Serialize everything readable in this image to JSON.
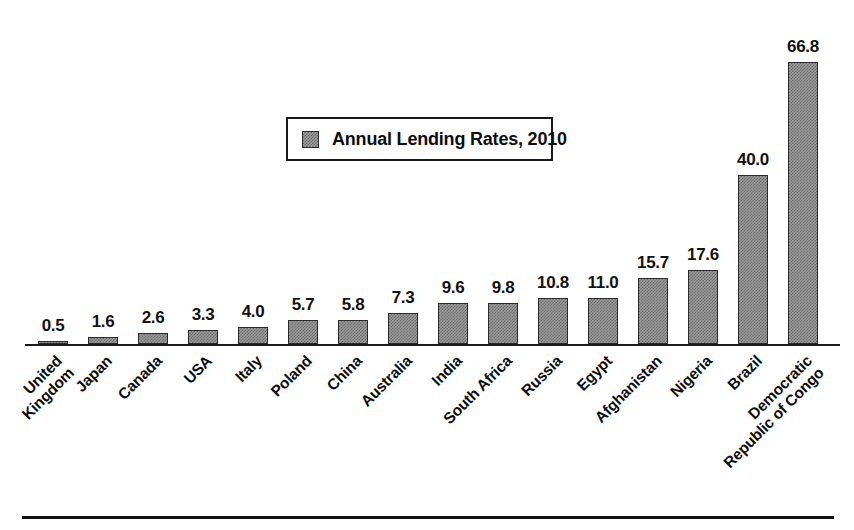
{
  "chart_data": {
    "type": "bar",
    "title": "",
    "subtitle": "",
    "xlabel": "",
    "ylabel": "",
    "ylim": [
      0,
      72
    ],
    "grid": false,
    "legend_position": "upper-center-inside",
    "series": [
      {
        "name": "Annual Lending Rates, 2010",
        "values": [
          0.5,
          1.6,
          2.6,
          3.3,
          4.0,
          5.7,
          5.8,
          7.3,
          9.6,
          9.8,
          10.8,
          11.0,
          15.7,
          17.6,
          40.0,
          66.8
        ]
      }
    ],
    "categories": [
      "United Kingdom",
      "Japan",
      "Canada",
      "USA",
      "Italy",
      "Poland",
      "China",
      "Australia",
      "India",
      "South Africa",
      "Russia",
      "Egypt",
      "Afghanistan",
      "Nigeria",
      "Brazil",
      "Democratic Republic of Congo"
    ],
    "category_label_lines": [
      [
        "United",
        "Kingdom"
      ],
      [
        "Japan"
      ],
      [
        "Canada"
      ],
      [
        "USA"
      ],
      [
        "Italy"
      ],
      [
        "Poland"
      ],
      [
        "China"
      ],
      [
        "Australia"
      ],
      [
        "India"
      ],
      [
        "South Africa"
      ],
      [
        "Russia"
      ],
      [
        "Egypt"
      ],
      [
        "Afghanistan"
      ],
      [
        "Nigeria"
      ],
      [
        "Brazil"
      ],
      [
        "Democratic",
        "Republic of Congo"
      ]
    ],
    "data_labels": [
      "0.5",
      "1.6",
      "2.6",
      "3.3",
      "4.0",
      "5.7",
      "5.8",
      "7.3",
      "9.6",
      "9.8",
      "10.8",
      "11.0",
      "15.7",
      "17.6",
      "40.0",
      "66.8"
    ],
    "annotations": []
  },
  "legend": {
    "entries": [
      {
        "label": "Annual Lending Rates, 2010",
        "swatch": "hatched-gray-swatch"
      }
    ]
  },
  "colors": {
    "bar_fill": "#9a9a9a",
    "bar_pattern": "#6d6d6d",
    "bar_stroke": "#2b2b2b",
    "axis": "#1a1a1a",
    "text": "#0d0d0d",
    "background": "#ffffff",
    "rule": "#111111"
  }
}
